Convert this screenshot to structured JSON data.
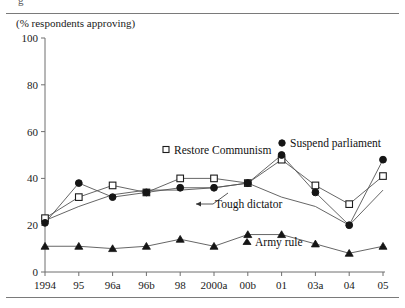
{
  "figure": {
    "clipped_top_glyph": "g",
    "axis_note": "(% respondents approving)"
  },
  "chart_data": {
    "type": "line",
    "title": "",
    "subtitle": "",
    "xlabel": "",
    "ylabel": "(% respondents approving)",
    "ylim": [
      0,
      100
    ],
    "yticks": [
      0,
      20,
      40,
      60,
      80,
      100
    ],
    "ytick_labels": [
      "0",
      "20",
      "40",
      "60",
      "80",
      "100"
    ],
    "grid": false,
    "legend": "inline-annotations",
    "categories": [
      "1994",
      "95",
      "96a",
      "96b",
      "98",
      "2000a",
      "00b",
      "01",
      "03a",
      "04",
      "05"
    ],
    "series": [
      {
        "name": "Restore Communism",
        "marker": "open-square",
        "values": [
          23,
          32,
          37,
          34,
          40,
          40,
          38,
          48,
          37,
          29,
          41
        ]
      },
      {
        "name": "Suspend parliament",
        "marker": "filled-circle",
        "values": [
          21,
          38,
          32,
          34,
          36,
          36,
          38,
          50,
          34,
          20,
          48
        ]
      },
      {
        "name": "Tough dictator",
        "marker": "none",
        "values": [
          22,
          28,
          33,
          35,
          35,
          36,
          38,
          32,
          28,
          20,
          35
        ]
      },
      {
        "name": "Army rule",
        "marker": "filled-triangle",
        "values": [
          11,
          11,
          10,
          11,
          14,
          11,
          16,
          16,
          12,
          8,
          11
        ]
      }
    ],
    "annotations": [
      {
        "text": "Restore Communism",
        "marker": "open-square"
      },
      {
        "text": "Suspend parliament",
        "marker": "filled-circle"
      },
      {
        "text": "Tough dictator",
        "marker": "arrow-leader"
      },
      {
        "text": "Army rule",
        "marker": "filled-triangle"
      }
    ]
  }
}
